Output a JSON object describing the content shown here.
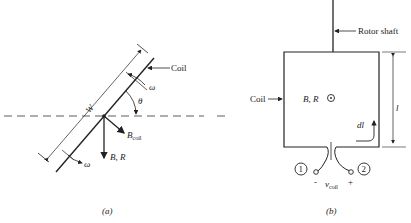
{
  "figure_a": {
    "caption": "(a)",
    "labels": {
      "coil": "Coil",
      "omega_top": "ω",
      "omega_bottom": "ω",
      "theta": "θ",
      "width": "W",
      "b_coil": "B",
      "b_coil_sub": "coil",
      "b_r": "B, R"
    }
  },
  "figure_b": {
    "caption": "(b)",
    "labels": {
      "rotor_shaft": "Rotor shaft",
      "coil": "Coil",
      "b_r": "B, R",
      "length": "l",
      "dl": "dl",
      "terminal_1": "1",
      "terminal_2": "2",
      "minus": "-",
      "plus": "+",
      "v_coil": "v",
      "v_coil_sub": "coil"
    }
  }
}
